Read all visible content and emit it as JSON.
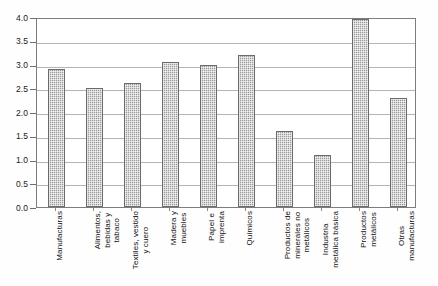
{
  "chart_data": {
    "type": "bar",
    "title": "",
    "subtitle": "",
    "xlabel": "",
    "ylabel": "",
    "ylim": [
      0.0,
      4.0
    ],
    "ytick_step": 0.5,
    "ytick_labels": [
      "0.0",
      "0.5",
      "1.0",
      "1.5",
      "2.0",
      "2.5",
      "3.0",
      "3.5",
      "4.0"
    ],
    "ytick_values": [
      0.0,
      0.5,
      1.0,
      1.5,
      2.0,
      2.5,
      3.0,
      3.5,
      4.0
    ],
    "grid": true,
    "grid_axis": "y",
    "legend": false,
    "legend_position": "none",
    "bar_fill": "#9a9a9a",
    "bar_pattern": "checkered-hatch",
    "bar_border": "#6b6b6b",
    "frame_color": "#7d7d7d",
    "gridline_color": "#b4b4b4",
    "categories": [
      "Manufacturas",
      "Alimentos, bebidas y tabaco",
      "Textiles, vestido y cuero",
      "Madera y muebles",
      "Papel e imprenta",
      "Químicos",
      "Productos de minerales no metálicos",
      "Industria metálica básica",
      "Productos metálicos",
      "Otras manufacturas"
    ],
    "category_lines": [
      [
        "Manufacturas"
      ],
      [
        "Alimentos,",
        "bebidas y",
        "tabaco"
      ],
      [
        "Textiles, vestido",
        "y cuero"
      ],
      [
        "Madera y",
        "muebles"
      ],
      [
        "Papel e",
        "imprenta"
      ],
      [
        "Químicos"
      ],
      [
        "Productos de",
        "minerales no",
        "metálicos"
      ],
      [
        "Industria",
        "metálica básica"
      ],
      [
        "Productos",
        "metálicos"
      ],
      [
        "Otras",
        "manufacturas"
      ]
    ],
    "values": [
      2.9,
      2.5,
      2.62,
      3.05,
      3.0,
      3.2,
      1.6,
      1.1,
      3.95,
      2.3
    ]
  }
}
